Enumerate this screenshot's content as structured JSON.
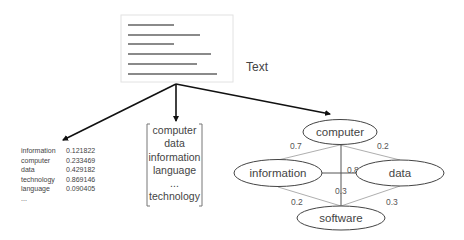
{
  "document": {
    "label": "Text",
    "line_count": 6
  },
  "word_frequency_table": {
    "rows": [
      {
        "word": "information",
        "value": "0.121822"
      },
      {
        "word": "computer",
        "value": "0.233469"
      },
      {
        "word": "data",
        "value": "0.429182"
      },
      {
        "word": "technology",
        "value": "0.869146"
      },
      {
        "word": "language",
        "value": "0.090405"
      }
    ],
    "ellipsis": "..."
  },
  "vocabulary_list": {
    "items": [
      "computer",
      "data",
      "information",
      "language",
      "...",
      "technology"
    ]
  },
  "graph": {
    "nodes": [
      {
        "id": "computer",
        "label": "computer"
      },
      {
        "id": "information",
        "label": "information"
      },
      {
        "id": "data",
        "label": "data"
      },
      {
        "id": "software",
        "label": "software"
      }
    ],
    "edges": [
      {
        "from": "computer",
        "to": "information",
        "weight": "0.7"
      },
      {
        "from": "computer",
        "to": "data",
        "weight": "0.2"
      },
      {
        "from": "information",
        "to": "data",
        "weight": "0.8"
      },
      {
        "from": "computer",
        "to": "software",
        "weight": "0.3"
      },
      {
        "from": "information",
        "to": "software",
        "weight": "0.2"
      },
      {
        "from": "data",
        "to": "software",
        "weight": "0.3"
      }
    ]
  }
}
